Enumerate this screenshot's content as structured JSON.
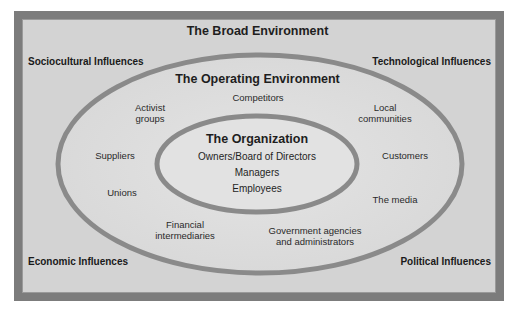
{
  "diagram": {
    "broad_environment": {
      "title": "The Broad Environment",
      "corners": {
        "top_left": "Sociocultural Influences",
        "top_right": "Technological Influences",
        "bottom_left": "Economic Influences",
        "bottom_right": "Political Influences"
      }
    },
    "operating_environment": {
      "title": "The Operating Environment",
      "items": {
        "competitors": "Competitors",
        "activist_1": "Activist",
        "activist_2": "groups",
        "local_1": "Local",
        "local_2": "communities",
        "suppliers": "Suppliers",
        "customers": "Customers",
        "unions": "Unions",
        "media": "The media",
        "financial_1": "Financial",
        "financial_2": "intermediaries",
        "government_1": "Government agencies",
        "government_2": "and administrators"
      }
    },
    "organization": {
      "title": "The Organization",
      "items": [
        "Owners/Board of Directors",
        "Managers",
        "Employees"
      ]
    },
    "colors": {
      "frame_border": "#7c7c7c",
      "background": "#d3d3d3",
      "ring_stroke": "#8a8a8a",
      "ellipse_fill": "#dedede",
      "text": "#1e1e1e"
    }
  }
}
